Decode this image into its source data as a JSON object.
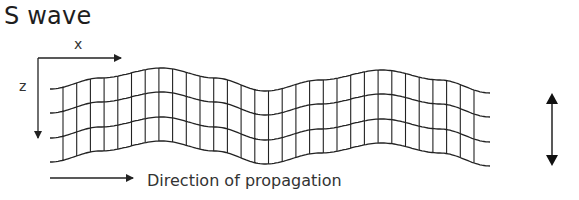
{
  "title": "S wave",
  "axes": {
    "x_label": "x",
    "z_label": "z"
  },
  "propagation": {
    "label": "Direction of propagation"
  },
  "particle_motion": {
    "icon": "double-headed-vertical-arrow"
  },
  "grid": {
    "horizontal_lines": 4,
    "vertical_lines": 31,
    "x_start": 50,
    "x_end": 490,
    "first_vertical_x": 63,
    "vertical_spacing": 13.7,
    "row_offsets": [
      0,
      24,
      49,
      73
    ],
    "top_line_points": [
      [
        50,
        89
      ],
      [
        100,
        78
      ],
      [
        162,
        68
      ],
      [
        215,
        78
      ],
      [
        265,
        91
      ],
      [
        320,
        80
      ],
      [
        382,
        70
      ],
      [
        440,
        80
      ],
      [
        490,
        93
      ]
    ],
    "stroke_color": "#222222"
  }
}
